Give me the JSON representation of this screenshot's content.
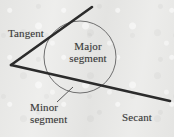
{
  "figure": {
    "background_color": "#e9e9e7",
    "ink_color": "#2b2b2b",
    "circle_stroke_color": "#6f6f6f",
    "labels": {
      "tangent": "Tangent",
      "major_line1": "Major",
      "major_line2": "segment",
      "minor_line1": "Minor",
      "minor_line2": "segment",
      "secant": "Secant"
    },
    "geometry": {
      "circle": {
        "cx": 80,
        "cy": 57,
        "r": 36
      },
      "vertex": {
        "x": 11,
        "y": 65
      },
      "tangent_end": {
        "x": 92,
        "y": 7
      },
      "secant_end": {
        "x": 170,
        "y": 101
      },
      "leader_start": {
        "x": 57,
        "y": 102
      },
      "leader_end": {
        "x": 73,
        "y": 87
      }
    }
  }
}
